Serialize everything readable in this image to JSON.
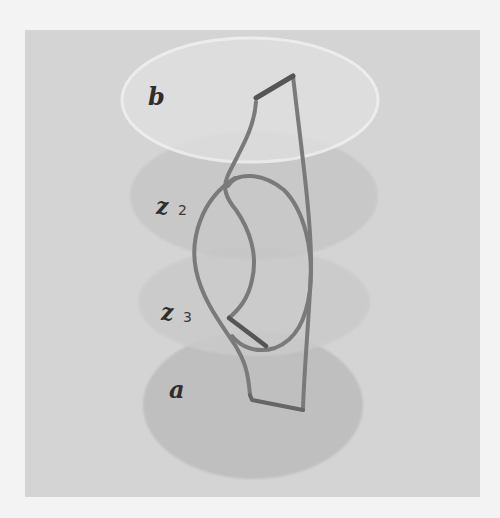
{
  "figure": {
    "colors": {
      "page_background": "#f3f3f3",
      "panel_background": "#d4d4d4",
      "disc_fill": "#bdbdbd",
      "disc_b_fill": "#e2e2e2",
      "disc_b_rim": "#f2f2f2",
      "curve_stroke": "#7a7a7a",
      "label_color": "#2e2e2e"
    },
    "discs": [
      {
        "id": "b",
        "label": "b",
        "subscript": "",
        "cx": 250,
        "cy": 100,
        "rx": 128,
        "ry": 62
      },
      {
        "id": "z2",
        "label": "z",
        "subscript": "2",
        "cx": 254,
        "cy": 196,
        "rx": 124,
        "ry": 64
      },
      {
        "id": "z3",
        "label": "z",
        "subscript": "3",
        "cx": 254,
        "cy": 302,
        "rx": 116,
        "ry": 54
      },
      {
        "id": "a",
        "label": "a",
        "subscript": "",
        "cx": 253,
        "cy": 405,
        "rx": 110,
        "ry": 74
      }
    ],
    "labels": {
      "b": "b",
      "z2_main": "z",
      "z2_sub": "2",
      "z3_main": "z",
      "z3_sub": "3",
      "a": "a"
    }
  }
}
